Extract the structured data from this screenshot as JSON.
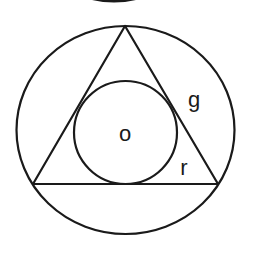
{
  "diagram": {
    "labels": {
      "center": "o",
      "slant": "g",
      "radius": "r"
    },
    "colors": {
      "stroke": "#1a1a1a",
      "background": "#ffffff"
    },
    "shapes": {
      "outer_circle": {
        "cx": 125.5,
        "cy": 130,
        "rx": 109,
        "ry": 104
      },
      "triangle": {
        "apex": [
          125,
          26
        ],
        "base_left": [
          33,
          184
        ],
        "base_right": [
          218,
          184
        ]
      },
      "inner_circle": {
        "cx": 125.5,
        "cy": 132.5,
        "r": 51.5
      },
      "top_partial_arc": {
        "from": [
          93,
          0
        ],
        "to": [
          135,
          0
        ]
      }
    }
  }
}
